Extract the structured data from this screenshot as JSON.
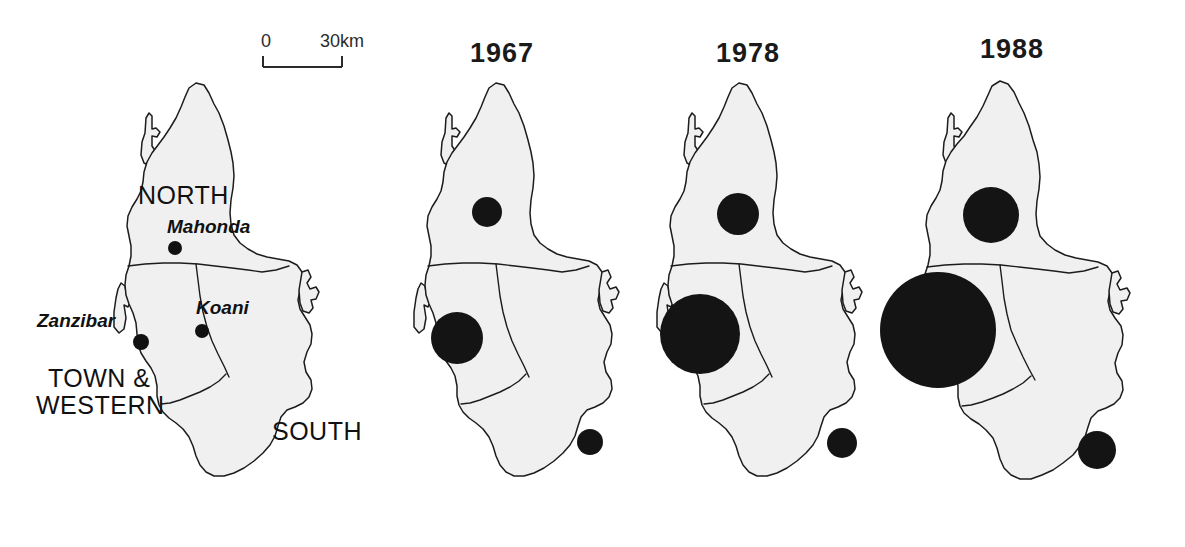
{
  "figure": {
    "type": "map",
    "background_color": "#ffffff",
    "land_fill": "#f0f0f0",
    "outline_color": "#1c1c1c",
    "symbol_color": "#141414"
  },
  "scale_bar": {
    "name": "scale-bar",
    "start_label": "0",
    "end_label": "30km"
  },
  "reference_map": {
    "title": "",
    "regions": [
      {
        "name": "north",
        "label": "NORTH"
      },
      {
        "name": "town-and-western",
        "label_line1": "TOWN &",
        "label_line2": "WESTERN"
      },
      {
        "name": "south",
        "label": "SOUTH"
      }
    ],
    "towns": [
      {
        "name": "mahonda",
        "label": "Mahonda"
      },
      {
        "name": "zanzibar",
        "label": "Zanzibar"
      },
      {
        "name": "koani",
        "label": "Koani"
      }
    ]
  },
  "year_maps": [
    {
      "name": "map-1967",
      "year": "1967",
      "circles": [
        {
          "region": "north",
          "radius_px": 15
        },
        {
          "region": "town-and-western",
          "radius_px": 26
        },
        {
          "region": "south",
          "radius_px": 13
        }
      ]
    },
    {
      "name": "map-1978",
      "year": "1978",
      "circles": [
        {
          "region": "north",
          "radius_px": 21
        },
        {
          "region": "town-and-western",
          "radius_px": 40
        },
        {
          "region": "south",
          "radius_px": 15
        }
      ]
    },
    {
      "name": "map-1988",
      "year": "1988",
      "circles": [
        {
          "region": "north",
          "radius_px": 28
        },
        {
          "region": "town-and-western",
          "radius_px": 58
        },
        {
          "region": "south",
          "radius_px": 19
        }
      ]
    }
  ],
  "chart_data": {
    "type": "map",
    "title": "",
    "symbol": "proportional circle",
    "categories": [
      "NORTH",
      "TOWN & WESTERN",
      "SOUTH"
    ],
    "series": [
      {
        "name": "1967",
        "values": [
          15,
          26,
          13
        ],
        "unit": "circle radius px"
      },
      {
        "name": "1978",
        "values": [
          21,
          40,
          15
        ],
        "unit": "circle radius px"
      },
      {
        "name": "1988",
        "values": [
          28,
          58,
          19
        ],
        "unit": "circle radius px"
      }
    ],
    "legend_position": "none",
    "grid": false
  }
}
